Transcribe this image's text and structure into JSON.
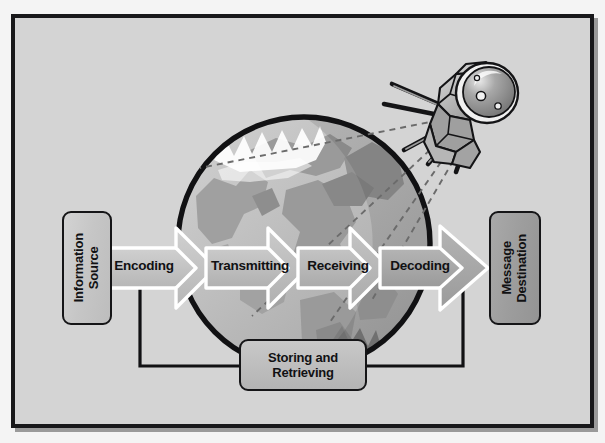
{
  "diagram": {
    "background_color": "#d4d4d4",
    "frame_color": "#18181a",
    "page_color": "#f4f4f4"
  },
  "source_box": {
    "label": "Information\nSource",
    "fill": "#c9c9c9",
    "text_orientation": "vertical-bottom-to-top"
  },
  "destination_box": {
    "label": "Message\nDestination",
    "fill": "#9d9d9d",
    "text_orientation": "vertical-bottom-to-top"
  },
  "storage_box": {
    "line1": "Storing and",
    "line2": "Retrieving",
    "fill": "#bcbcbc"
  },
  "arrows": [
    {
      "label": "Encoding",
      "fill": "#c3c3c3",
      "outline": "#ffffff"
    },
    {
      "label": "Transmitting",
      "fill": "#bdbdbd",
      "outline": "#ffffff"
    },
    {
      "label": "Receiving",
      "fill": "#b7b7b7",
      "outline": "#ffffff"
    },
    {
      "label": "Decoding",
      "fill": "#a8a8a8",
      "outline": "#ffffff"
    }
  ],
  "globe": {
    "name": "earth-globe",
    "outline": "#111113",
    "ocean": "#c2c2c2",
    "land": "#9d9d9d",
    "highlight": "#ffffff"
  },
  "satellite": {
    "name": "sputnik-satellite",
    "body_fill": "#b4b4b4",
    "dome_fill": "#8e8e8e",
    "outline": "#141416",
    "antenna_count": 4
  },
  "signal_lines": {
    "style": "dashed",
    "color": "#6e6e6e",
    "count": 4
  },
  "connectors": {
    "style": "solid",
    "color": "#111113",
    "description": "Encoding and Decoding link down to Storing and Retrieving"
  }
}
